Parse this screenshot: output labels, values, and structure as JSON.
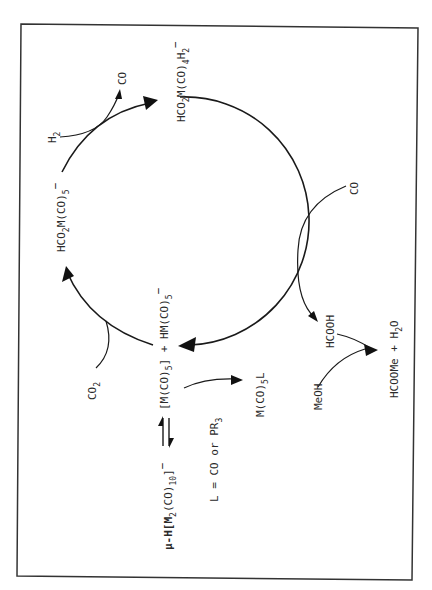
{
  "diagram": {
    "orientation": "rotated 90 degrees counter-clockwise",
    "cycle_species": {
      "top": "HCO2M(CO)4H2−",
      "left": "HCO2M(CO)5−",
      "bottom": "[M(CO)5] + HM(CO)5−"
    },
    "labels": {
      "top_main": "HCO",
      "top_sub1": "2",
      "top_mid": "M(CO)",
      "top_sub2": "4",
      "top_h": "H",
      "top_sub3": "2",
      "top_charge": "−",
      "left_main": "HCO",
      "left_sub1": "2",
      "left_mid": "M(CO)",
      "left_sub2": "5",
      "left_charge": "−",
      "bottom_a": "[M(CO)",
      "bottom_a_sub": "5",
      "bottom_b": "] + HM(CO)",
      "bottom_b_sub": "5",
      "bottom_charge": "−",
      "h2": "H",
      "h2_sub": "2",
      "co_out": "CO",
      "co_in": "CO",
      "co2": "CO",
      "co2_sub": "2",
      "hcooh": "HCOOH",
      "meoh": "MeOH",
      "product_a": "HCOOMe + H",
      "product_sub": "2",
      "product_b": "O",
      "dimer_a": "μ-H[M",
      "dimer_sub1": "2",
      "dimer_b": "(CO)",
      "dimer_sub2": "10",
      "dimer_c": "]",
      "dimer_charge": "−",
      "ligand_product": "M(CO)",
      "ligand_product_sub": "5",
      "ligand_product_l": "L",
      "ligand_def": "L = CO or PR",
      "ligand_def_sub": "3"
    },
    "reactants": [
      "H2",
      "CO",
      "CO2",
      "MeOH"
    ],
    "products": [
      "CO",
      "HCOOH",
      "HCOOMe + H2O",
      "M(CO)5L"
    ],
    "equilibrium": "μ-H[M2(CO)10]− ⇌ [M(CO)5] + HM(CO)5−",
    "colors": {
      "ink": "#1a1a1a",
      "background": "#ffffff"
    }
  }
}
